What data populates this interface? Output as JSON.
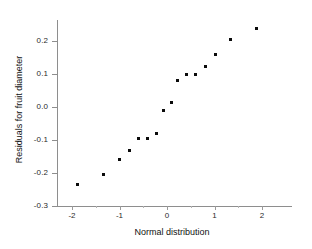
{
  "chart_data": {
    "type": "scatter",
    "title": "",
    "xlabel": "Normal distribution",
    "ylabel": "Residuals for fruit diameter",
    "xlim": [
      -2.42,
      2.63
    ],
    "ylim": [
      -0.3,
      0.263
    ],
    "grid": false,
    "legend": null,
    "x_ticks": [
      -2,
      -1,
      0,
      1,
      2
    ],
    "x_tick_labels": [
      "-2",
      "-1",
      "0",
      "1",
      "2"
    ],
    "x_minor_ticks": [
      -1.5,
      -0.5,
      0.5,
      1.5
    ],
    "y_ticks": [
      -0.3,
      -0.2,
      -0.1,
      0.0,
      0.1,
      0.2
    ],
    "y_tick_labels": [
      "-0.3",
      "-0.2",
      "-0.1",
      "0.0",
      "0.1",
      "0.2"
    ],
    "marker": "square",
    "marker_color": "#0b0b0b",
    "marker_size": 3,
    "axis_color": "#8e8e8e",
    "background": "#ffffff",
    "points": [
      {
        "x": -1.88,
        "y": -0.236
      },
      {
        "x": -1.33,
        "y": -0.206
      },
      {
        "x": -1.01,
        "y": -0.158
      },
      {
        "x": -0.8,
        "y": -0.133
      },
      {
        "x": -0.61,
        "y": -0.094
      },
      {
        "x": -0.42,
        "y": -0.094
      },
      {
        "x": -0.23,
        "y": -0.079
      },
      {
        "x": -0.08,
        "y": -0.012
      },
      {
        "x": 0.09,
        "y": 0.015
      },
      {
        "x": 0.23,
        "y": 0.079
      },
      {
        "x": 0.4,
        "y": 0.097
      },
      {
        "x": 0.59,
        "y": 0.097
      },
      {
        "x": 0.8,
        "y": 0.124
      },
      {
        "x": 1.03,
        "y": 0.158
      },
      {
        "x": 1.33,
        "y": 0.206
      },
      {
        "x": 1.88,
        "y": 0.239
      }
    ]
  }
}
